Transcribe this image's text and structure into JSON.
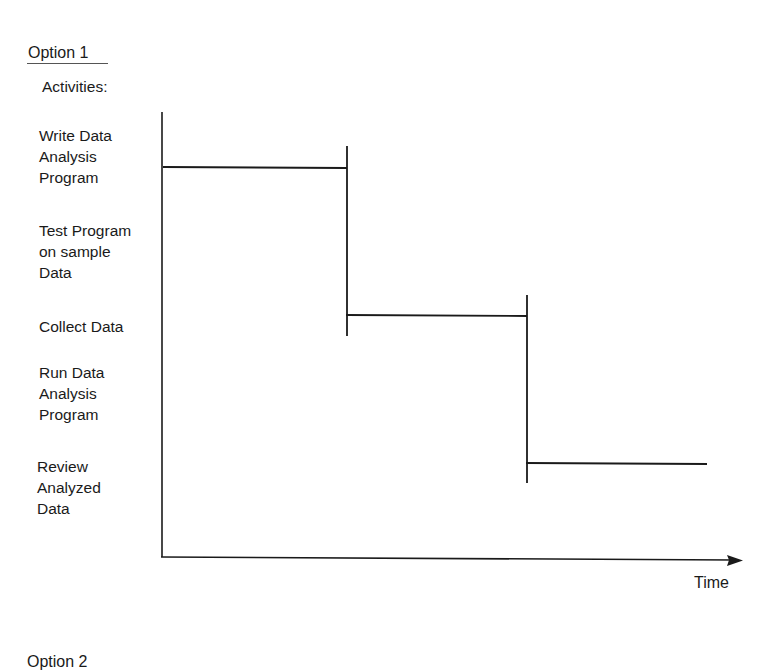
{
  "heading": "Option 1",
  "subheading": "Activities:",
  "next_heading": "Option 2",
  "chart_data": {
    "type": "gantt",
    "title": "Option 1",
    "ylabel": "Activities:",
    "xlabel": "Time",
    "grid": false,
    "axis_color": "#1a1a1a",
    "activities": [
      {
        "label": "Write Data\nAnalysis\nProgram",
        "start": 0,
        "end": 1,
        "x1": 163,
        "x2": 347,
        "y": 167,
        "tick_start_top": 146,
        "tick_end_top": 146
      },
      {
        "label": "Test Program\non sample\nData",
        "start": null,
        "end": null
      },
      {
        "label": "Collect Data",
        "start": 1,
        "end": 2,
        "x1": 346,
        "x2": 527,
        "y": 315,
        "tick_start_top": 146,
        "tick_start_bottom": 336,
        "tick_end_top": 295
      },
      {
        "label": "Run Data\nAnalysis\nProgram",
        "start": null,
        "end": null
      },
      {
        "label": "Review\nAnalyzed\nData",
        "start": 2,
        "end": 3,
        "x1": 526,
        "x2": 707,
        "y": 463,
        "tick_start_top": 295,
        "tick_start_bottom": 483
      }
    ],
    "note": "Sequential schedule: writing program, collecting data, and reviewing data occur one after another; test and run activities have no bars."
  },
  "labels": [
    {
      "text": "Write Data\nAnalysis\nProgram",
      "left": 39,
      "top": 125
    },
    {
      "text": "Test Program\non sample\nData",
      "left": 39,
      "top": 220
    },
    {
      "text": "Collect Data",
      "left": 39,
      "top": 316
    },
    {
      "text": "Run Data\nAnalysis\nProgram",
      "left": 39,
      "top": 362
    },
    {
      "text": "Review\nAnalyzed\nData",
      "left": 37,
      "top": 456
    }
  ]
}
